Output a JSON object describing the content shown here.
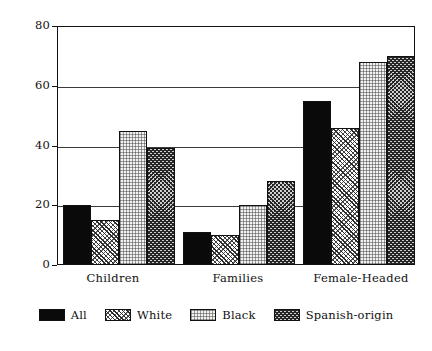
{
  "chart_data": {
    "type": "bar",
    "title": "",
    "subtitle": "",
    "xlabel": "",
    "ylabel": "",
    "categories": [
      "Children",
      "Families",
      "Female-Headed"
    ],
    "series": [
      {
        "name": "All",
        "pattern": "solid",
        "values": [
          20,
          11,
          55
        ]
      },
      {
        "name": "White",
        "pattern": "hatch",
        "values": [
          15,
          10,
          46
        ]
      },
      {
        "name": "Black",
        "pattern": "stipple",
        "values": [
          45,
          20,
          68
        ]
      },
      {
        "name": "Spanish-origin",
        "pattern": "crosshatch",
        "values": [
          39,
          28,
          70
        ]
      }
    ],
    "ylim": [
      0,
      80
    ],
    "yticks": [
      0,
      20,
      40,
      60,
      80
    ],
    "ytick_labels": [
      "0",
      "20",
      "40",
      "60",
      "80"
    ],
    "grid": true,
    "grid_axis": "y",
    "legend_position": "bottom",
    "colors": {
      "axis": "#111111",
      "grid": "#3b3b3b",
      "background": "#ffffff",
      "all": "#0a0a0a",
      "white": "#9a9a9a",
      "black": "#f2f2f2",
      "spanish_origin": "#6b6b6b"
    }
  },
  "legend": {
    "items": [
      {
        "label": "All"
      },
      {
        "label": "White"
      },
      {
        "label": "Black"
      },
      {
        "label": "Spanish-origin"
      }
    ]
  }
}
